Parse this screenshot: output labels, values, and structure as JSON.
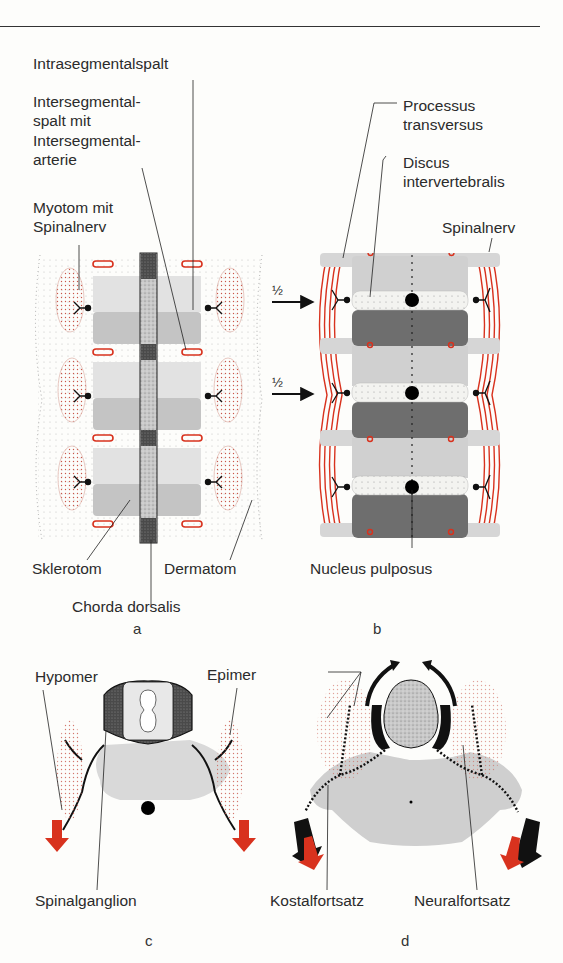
{
  "panels": {
    "a": {
      "letter": "a",
      "labels": {
        "intrasegmentalspalt": "Intrasegmentalspalt",
        "intersegmental_line1": "Intersegmental-",
        "intersegmental_line2": "spalt mit",
        "intersegmental_line3": "Intersegmental-",
        "intersegmental_line4": "arterie",
        "myotom_line1": "Myotom mit",
        "myotom_line2": "Spinalnerv",
        "sklerotom": "Sklerotom",
        "dermatom": "Dermatom",
        "chorda": "Chorda dorsalis"
      }
    },
    "b": {
      "letter": "b",
      "labels": {
        "processus_line1": "Processus",
        "processus_line2": "transversus",
        "discus_line1": "Discus",
        "discus_line2": "intervertebralis",
        "spinalnerv": "Spinalnerv",
        "nucleus": "Nucleus pulposus"
      },
      "arrow_fraction": "½"
    },
    "c": {
      "letter": "c",
      "labels": {
        "hypomer": "Hypomer",
        "epimer": "Epimer",
        "spinalganglion": "Spinalganglion"
      }
    },
    "d": {
      "letter": "d",
      "labels": {
        "kostalfortsatz": "Kostalfortsatz",
        "neuralfortsatz": "Neuralfortsatz"
      }
    }
  },
  "colors": {
    "red_accent": "#d8321e",
    "dark_gray": "#5a5a5a",
    "light_gray": "#cfcfcf",
    "stipple_red": "#c9574a"
  }
}
